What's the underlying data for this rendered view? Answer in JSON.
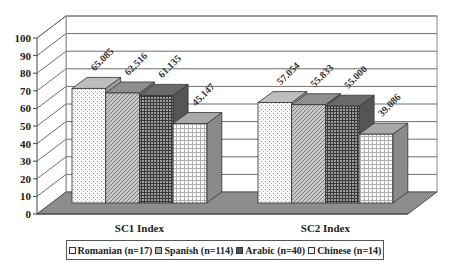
{
  "chart_data": {
    "type": "bar",
    "style": "3d-clustered-column",
    "title": "",
    "xlabel": "",
    "ylabel": "",
    "categories": [
      "SC1 Index",
      "SC2 Index"
    ],
    "series": [
      {
        "name": "Romanian (n=17)",
        "values": [
          65.085,
          57.054
        ],
        "labels": [
          "65.085",
          "57.054"
        ],
        "fill": "#f4f4f4",
        "pattern": "dots"
      },
      {
        "name": "Spanish (n=114)",
        "values": [
          62.516,
          55.833
        ],
        "labels": [
          "62.516",
          "55.833"
        ],
        "fill": "#bdbdbd",
        "pattern": "diagonal"
      },
      {
        "name": "Arabic (n=40)",
        "values": [
          61.135,
          55.0
        ],
        "labels": [
          "61.135",
          "55.000"
        ],
        "fill": "#7a7a7a",
        "pattern": "grid-dark"
      },
      {
        "name": "Chinese (n=14)",
        "values": [
          45.147,
          39.086
        ],
        "labels": [
          "45.147",
          "39.086"
        ],
        "fill": "#f0f0f0",
        "pattern": "grid-light"
      }
    ],
    "yticks": [
      "0",
      "10",
      "20",
      "30",
      "40",
      "50",
      "60",
      "70",
      "80",
      "90",
      "100"
    ],
    "ylim": [
      0,
      100
    ],
    "grid": true,
    "legend_position": "bottom"
  },
  "legend": {
    "items": [
      {
        "label": "Romanian (n=17)"
      },
      {
        "label": "Spanish (n=114)"
      },
      {
        "label": "Arabic (n=40)"
      },
      {
        "label": "Chinese (n=14)"
      }
    ]
  }
}
